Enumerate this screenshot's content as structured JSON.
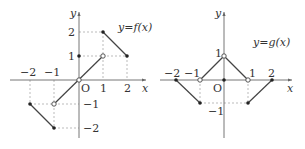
{
  "graphs": [
    {
      "id": "f",
      "label": "y=f(x)",
      "axis_x_label": "x",
      "axis_y_label": "y",
      "origin_label": "O",
      "x_ticks": [
        "−2",
        "−1",
        "1",
        "2"
      ],
      "y_ticks": [
        "2",
        "1",
        "−1",
        "−2"
      ],
      "segments": [
        {
          "from": [
            -2,
            -1
          ],
          "to": [
            -1,
            -2
          ]
        },
        {
          "from": [
            -1,
            -1
          ],
          "to": [
            1,
            1
          ]
        },
        {
          "from": [
            1,
            2
          ],
          "to": [
            2,
            1
          ]
        }
      ],
      "closed_points": [
        [
          -2,
          -1
        ],
        [
          -1,
          -2
        ],
        [
          0,
          1
        ],
        [
          1,
          2
        ],
        [
          2,
          1
        ]
      ],
      "open_points": [
        [
          -1,
          -1
        ],
        [
          0,
          0
        ],
        [
          1,
          1
        ]
      ]
    },
    {
      "id": "g",
      "label": "y=g(x)",
      "axis_x_label": "x",
      "axis_y_label": "y",
      "origin_label": "O",
      "x_ticks": [
        "−2",
        "−1",
        "1",
        "2"
      ],
      "y_ticks": [
        "1",
        "−1"
      ],
      "segments": [
        {
          "from": [
            -2,
            0
          ],
          "to": [
            -1,
            -1
          ]
        },
        {
          "from": [
            -1,
            0
          ],
          "to": [
            0,
            1
          ]
        },
        {
          "from": [
            0,
            1
          ],
          "to": [
            1,
            0
          ]
        },
        {
          "from": [
            1,
            -1
          ],
          "to": [
            2,
            0
          ]
        }
      ],
      "closed_points": [
        [
          -2,
          0
        ],
        [
          -1,
          -1
        ],
        [
          0,
          0
        ],
        [
          1,
          -1
        ],
        [
          2,
          0
        ]
      ],
      "open_points": [
        [
          -1,
          0
        ],
        [
          0,
          1
        ],
        [
          1,
          0
        ]
      ]
    }
  ],
  "colors": {
    "axis": "#666666",
    "line": "#444444",
    "dash": "#aaaaaa",
    "point": "#222222"
  }
}
